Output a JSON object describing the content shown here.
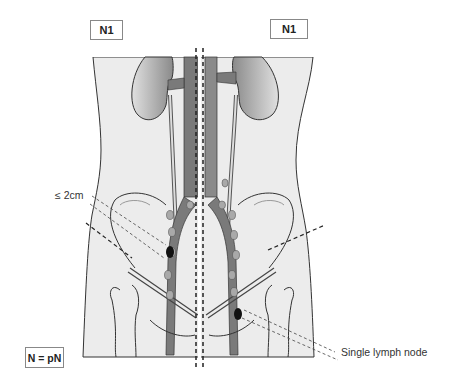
{
  "labels": {
    "left_stage": "N1",
    "right_stage": "N1",
    "size_annotation": "≤ 2cm",
    "node_annotation": "Single lymph node",
    "legend": "N = pN"
  },
  "colors": {
    "body_fill": "#ececec",
    "outline": "#333333",
    "vessel_fill": "#7a7a7a",
    "kidney_fill": "#9a9a9a",
    "lymph_node_fill": "#a9a9a9",
    "positive_node_fill": "#111111"
  }
}
